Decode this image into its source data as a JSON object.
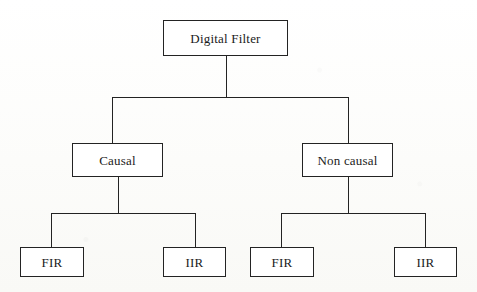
{
  "diagram": {
    "type": "tree",
    "background_color": "#fdfdfb",
    "line_color": "#232323",
    "box_fill_color": "#ffffff",
    "text_color": "#1b1b1b",
    "levels": 3,
    "root": {
      "id": "digital-filter",
      "label": "Digital Filter",
      "font_size_px": 13,
      "box": {
        "x": 163,
        "y": 20,
        "w": 125,
        "h": 36
      }
    },
    "level2": [
      {
        "id": "causal",
        "label": "Causal",
        "font_size_px": 13,
        "box": {
          "x": 72,
          "y": 143,
          "w": 91,
          "h": 34
        }
      },
      {
        "id": "non-causal",
        "label": "Non causal",
        "font_size_px": 13,
        "box": {
          "x": 302,
          "y": 143,
          "w": 91,
          "h": 34
        }
      }
    ],
    "level3": [
      {
        "id": "causal-fir",
        "label": "FIR",
        "parent": "causal",
        "font_size_px": 13,
        "box": {
          "x": 20,
          "y": 247,
          "w": 64,
          "h": 30
        }
      },
      {
        "id": "causal-iir",
        "label": "IIR",
        "parent": "causal",
        "font_size_px": 13,
        "box": {
          "x": 163,
          "y": 247,
          "w": 63,
          "h": 30
        }
      },
      {
        "id": "non-causal-fir",
        "label": "FIR",
        "parent": "non-causal",
        "font_size_px": 13,
        "box": {
          "x": 250,
          "y": 247,
          "w": 64,
          "h": 30
        }
      },
      {
        "id": "non-causal-iir",
        "label": "IIR",
        "parent": "non-causal",
        "font_size_px": 13,
        "box": {
          "x": 394,
          "y": 247,
          "w": 63,
          "h": 30
        }
      }
    ],
    "connectors": {
      "root_stem": {
        "x": 226,
        "y1": 56,
        "y2": 97
      },
      "bus_top": {
        "y": 97,
        "x1": 112,
        "x2": 348
      },
      "drop_causal": {
        "x": 112,
        "y1": 97,
        "y2": 143
      },
      "drop_non_causal": {
        "x": 348,
        "y1": 97,
        "y2": 143
      },
      "stem_causal": {
        "x": 118,
        "y1": 177,
        "y2": 213
      },
      "bus_left": {
        "y": 213,
        "x1": 51,
        "x2": 195
      },
      "drop_causal_fir": {
        "x": 51,
        "y1": 213,
        "y2": 247
      },
      "drop_causal_iir": {
        "x": 195,
        "y1": 213,
        "y2": 247
      },
      "stem_non_causal": {
        "x": 348,
        "y1": 177,
        "y2": 213
      },
      "bus_right": {
        "y": 213,
        "x1": 281,
        "x2": 425
      },
      "drop_non_causal_fir": {
        "x": 281,
        "y1": 213,
        "y2": 247
      },
      "drop_non_causal_iir": {
        "x": 425,
        "y1": 213,
        "y2": 247
      }
    }
  }
}
